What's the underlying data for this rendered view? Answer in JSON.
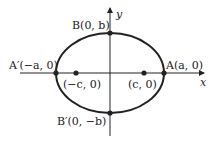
{
  "diagram": {
    "type": "ellipse-with-axes",
    "axes": {
      "x_label": "x",
      "y_label": "y"
    },
    "points": [
      {
        "id": "A",
        "label": "A(a, 0)"
      },
      {
        "id": "A_prime",
        "label": "A′(−a, 0)"
      },
      {
        "id": "B",
        "label": "B(0, b)"
      },
      {
        "id": "B_prime",
        "label": "B′(0, −b)"
      },
      {
        "id": "focus_right",
        "label": "(c, 0)"
      },
      {
        "id": "focus_left",
        "label": "(−c, 0)"
      }
    ]
  }
}
